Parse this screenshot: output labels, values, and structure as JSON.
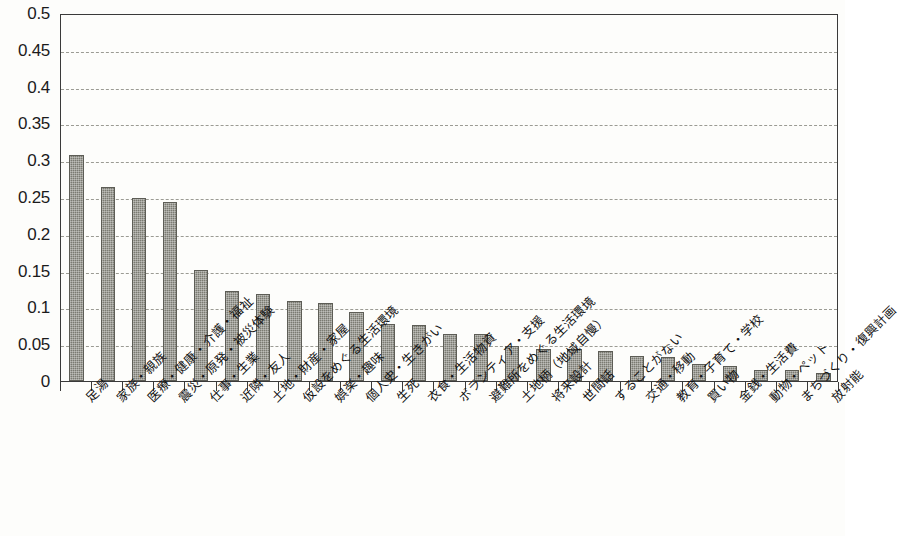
{
  "chart_data": {
    "type": "bar",
    "title": "",
    "subtitle": "",
    "xlabel": "",
    "ylabel": "",
    "ylim": [
      0,
      0.5
    ],
    "yticks": [
      "0",
      "0.05",
      "0.1",
      "0.15",
      "0.2",
      "0.25",
      "0.3",
      "0.35",
      "0.4",
      "0.45",
      "0.5"
    ],
    "ytick_values": [
      0,
      0.05,
      0.1,
      0.15,
      0.2,
      0.25,
      0.3,
      0.35,
      0.4,
      0.45,
      0.5
    ],
    "grid": "horizontal-dashed",
    "legend": "none",
    "bar_color": "#7b7b72",
    "bar_edge_color": "#5d5d56",
    "axis_color": "#3a3a3a",
    "gridline_color": "#9b9b93",
    "background_color": "#fdfdfb",
    "categories": [
      "足湯",
      "家族・親族",
      "医療・健康・介護・福祉",
      "震災・原発・被災体験",
      "仕事・生業",
      "近隣・友人",
      "土地・財産・家屋",
      "仮設をめぐる生活環境",
      "娯楽・趣味",
      "個人史・生きがい",
      "生死",
      "衣食・生活物資",
      "ボランティア・支援",
      "避難所をめぐる生活環境",
      "土地柄（地域自慢）",
      "将来設計",
      "世間話",
      "することがない",
      "交通・移動",
      "教育・子育て・学校",
      "買い物",
      "金銭・生活費",
      "動物・ペット",
      "まちづくり・復興計画",
      "放射能"
    ],
    "values": [
      0.307,
      0.263,
      0.249,
      0.243,
      0.151,
      0.122,
      0.118,
      0.109,
      0.106,
      0.094,
      0.077,
      0.076,
      0.064,
      0.064,
      0.047,
      0.044,
      0.044,
      0.041,
      0.034,
      0.033,
      0.023,
      0.021,
      0.015,
      0.015,
      0.011
    ]
  }
}
